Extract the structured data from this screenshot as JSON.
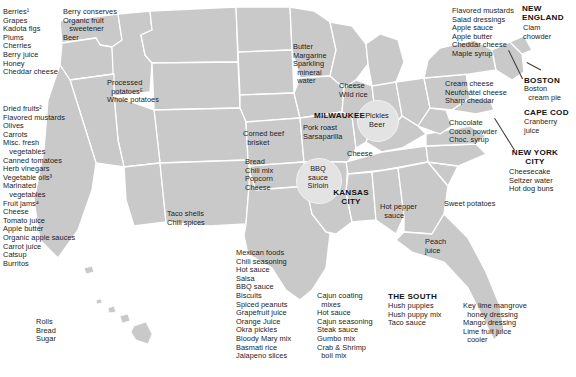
{
  "figure": {
    "type": "map-diagram",
    "map_fill": "#c9c9c9",
    "map_stroke": "#ffffff",
    "background": "#ffffff",
    "text_color": "#1c1c1c"
  },
  "city_labels": [
    {
      "name": "milwaukee",
      "text": "MILWAUKEE"
    },
    {
      "name": "kansas-city",
      "text": "KANSAS\nCITY"
    },
    {
      "name": "new-england",
      "text": "NEW\nENGLAND"
    },
    {
      "name": "boston",
      "text": "BOSTON"
    },
    {
      "name": "cape-cod",
      "text": "CAPE COD"
    },
    {
      "name": "new-york-city",
      "text": "NEW YORK\nCITY"
    },
    {
      "name": "the-south",
      "text": "THE SOUTH"
    }
  ],
  "annotations": {
    "pacific_northwest": {
      "label": "pacific-northwest-products",
      "items": [
        "Berry conserves",
        "Organic fruit",
        "   sweetener",
        "Beer"
      ]
    },
    "west_coast_north": {
      "label": "northern-california-products",
      "items": [
        "Berries¹",
        "Grapes",
        "Kadota figs",
        "Plums",
        "Cherries",
        "Berry juice",
        "Honey",
        "Cheddar cheese"
      ]
    },
    "west_coast_central": {
      "label": "california-products",
      "items": [
        "Dried fruits²",
        "Flavored mustards",
        "Olives",
        "Carrots",
        "Misc. fresh",
        "   vegetables",
        "Canned tomatoes",
        "Herb vinegars",
        "Vegetable oils³",
        "Marinated",
        "   vegetables",
        "Fruit jams⁴",
        "Cheese",
        "Tomato juice",
        "Apple butter",
        "Organic apple sauces",
        "Carrot juice",
        "Catsup",
        "Burritos"
      ]
    },
    "hawaii": {
      "label": "hawaii-products",
      "items": [
        "Rolls",
        "Bread",
        "Sugar"
      ]
    },
    "idaho": {
      "label": "idaho-products",
      "items": [
        "Processed",
        "  potatoes⁵",
        "Whole potatoes"
      ]
    },
    "southwest": {
      "label": "southwest-products",
      "items": [
        "Taco shells",
        "Chili spices"
      ]
    },
    "minnesota": {
      "label": "minnesota-products",
      "items": [
        "Butter",
        "Margarine",
        "Sparkling",
        "  mineral",
        "  water"
      ]
    },
    "wisconsin": {
      "label": "wisconsin-products",
      "items": [
        "Cheese",
        "Wild rice"
      ]
    },
    "pickles_beer_circle": {
      "label": "pickles-beer-circle",
      "items": [
        "Pickles",
        "Beer"
      ]
    },
    "iowa": {
      "label": "iowa-products",
      "items": [
        "Corned beef",
        "  brisket"
      ]
    },
    "missouri": {
      "label": "missouri-products",
      "items": [
        "Pork roast",
        "Sarsaparilla"
      ]
    },
    "illinois": {
      "label": "illinois-products",
      "items": [
        "Cheese"
      ]
    },
    "kansas": {
      "label": "kansas-products",
      "items": [
        "Bread",
        "Chili mix",
        "Popcorn",
        "Cheese"
      ]
    },
    "bbq_circle": {
      "label": "bbq-sauce-circle",
      "items": [
        "BBQ",
        "sauce",
        "Sirloin"
      ]
    },
    "tennessee": {
      "label": "tennessee-products",
      "items": [
        "Hot pepper",
        "  sauce"
      ]
    },
    "north_carolina": {
      "label": "north-carolina-products",
      "items": [
        "Sweet potatoes"
      ]
    },
    "georgia": {
      "label": "georgia-products",
      "items": [
        "Peach",
        "juice"
      ]
    },
    "texas": {
      "label": "texas-products",
      "items": [
        "Mexican foods",
        "Chili seasoning",
        "Hot sauce",
        "Salsa",
        "BBQ sauce",
        "Biscuits",
        "Spiced peanuts",
        "Grapefruit juice",
        "Orange Juice",
        "Okra pickles",
        "Bloody Mary mix",
        "Basmati rice",
        "Jalapeno slices"
      ]
    },
    "louisiana": {
      "label": "louisiana-products",
      "items": [
        "Cajun coating",
        "  mixes",
        "Hot sauce",
        "Cajun seasoning",
        "Steak sauce",
        "Gumbo mix",
        "Crab & Shrimp",
        "  boil mix"
      ]
    },
    "the_south_items": {
      "label": "the-south-products",
      "items": [
        "Hush puppies",
        "Hush puppy mix",
        "Taco sauce"
      ]
    },
    "florida_keys": {
      "label": "florida-keys-products",
      "items": [
        "Key lime mangrove",
        "  honey dressing",
        "Mango dressing",
        "Lime fruit juice",
        "  cooler"
      ]
    },
    "new_england_items": {
      "label": "new-england-products",
      "items": [
        "Clam",
        "chowder"
      ]
    },
    "vermont": {
      "label": "vermont-newyork-products",
      "items": [
        "Flavored mustards",
        "Salad dressings",
        "Apple sauce",
        "Apple butter",
        "Cheddar cheese",
        "Maple syrup"
      ]
    },
    "boston_items": {
      "label": "boston-products",
      "items": [
        "Boston",
        "  cream pie"
      ]
    },
    "cape_cod_items": {
      "label": "cape-cod-products",
      "items": [
        "Cranberry",
        "juice"
      ]
    },
    "new_york_state": {
      "label": "new-york-state-products",
      "items": [
        "Cream cheese",
        "Neufchâtel cheese",
        "Sharp cheddar"
      ]
    },
    "pennsylvania": {
      "label": "pennsylvania-products",
      "items": [
        "Chocolate",
        "Cocoa powder",
        "Choc. syrup"
      ]
    },
    "nyc_items": {
      "label": "new-york-city-products",
      "items": [
        "Cheesecake",
        "Seltzer water",
        "Hot dog buns"
      ]
    }
  }
}
